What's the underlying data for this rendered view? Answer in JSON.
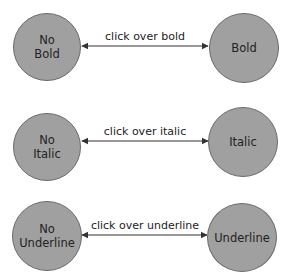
{
  "diagram": {
    "colors": {
      "node_fill": "#a0a0a0",
      "node_border": "#6a6a6a",
      "text": "#222222",
      "arrow": "#333333"
    },
    "rows": [
      {
        "left": {
          "line1": "No",
          "line2": "Bold"
        },
        "right": {
          "line1": "Bold"
        },
        "edge_label": "click over bold"
      },
      {
        "left": {
          "line1": "No",
          "line2": "Italic"
        },
        "right": {
          "line1": "Italic"
        },
        "edge_label": "click over italic"
      },
      {
        "left": {
          "line1": "No",
          "line2": "Underline"
        },
        "right": {
          "line1": "Underline"
        },
        "edge_label": "click over underline"
      }
    ]
  }
}
